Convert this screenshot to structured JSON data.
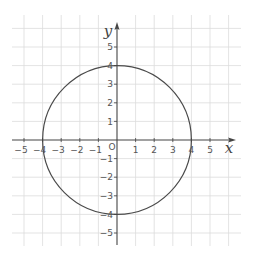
{
  "chart_data": {
    "type": "line",
    "title": "",
    "xlabel": "x",
    "ylabel": "y",
    "origin_label": "O",
    "xlim": [
      -5.6,
      6.6
    ],
    "ylim": [
      -5.6,
      6.6
    ],
    "grid": true,
    "legend": null,
    "x_ticks": [
      -5,
      -4,
      -3,
      -2,
      -1,
      1,
      2,
      3,
      4,
      5
    ],
    "y_ticks": [
      -5,
      -4,
      -3,
      -2,
      -1,
      1,
      2,
      3,
      4,
      5
    ],
    "series": [
      {
        "name": "circle",
        "shape": "circle",
        "equation": "x^2 + y^2 = 16",
        "center": [
          0,
          0
        ],
        "radius": 4
      }
    ]
  },
  "layout": {
    "origin_px": [
      117,
      140
    ],
    "unit_px": 18.6,
    "grid_bounds_px": {
      "left": 12,
      "right": 241,
      "top": 15,
      "bottom": 246
    }
  },
  "colors": {
    "grid": "#dcdcdc",
    "axis": "#444444",
    "curve": "#4a4a4a",
    "label": "#555555"
  }
}
